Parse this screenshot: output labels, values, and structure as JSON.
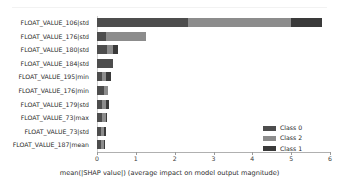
{
  "chart_data": {
    "type": "bar",
    "orientation": "horizontal",
    "stacked": true,
    "title": "",
    "xlabel": "mean(|SHAP value|) (average impact on model output magnitude)",
    "ylabel": "",
    "xlim": [
      0,
      6
    ],
    "xticks": [
      0,
      1,
      2,
      3,
      4,
      5,
      6
    ],
    "xticklabels": [
      "0",
      "1",
      "2",
      "3",
      "4",
      "5",
      "6"
    ],
    "grid": false,
    "legend_position": "lower right",
    "categories": [
      "FLOAT_VALUE_106|std",
      "FLOAT_VALUE_176|std",
      "FLOAT_VALUE_180|std",
      "FLOAT_VALUE_184|std",
      "FLOAT_VALUE_195|min",
      "FLOAT_VALUE_176|min",
      "FLOAT_VALUE_179|std",
      "FLOAT_VALUE_73|max",
      "FLOAT_VALUE_73|std",
      "FLOAT_VALUE_187|mean"
    ],
    "series": [
      {
        "name": "Class 0",
        "color": "#4d4d4d",
        "values": [
          2.35,
          0.22,
          0.27,
          0.42,
          0.12,
          0.18,
          0.14,
          0.13,
          0.11,
          0.1
        ]
      },
      {
        "name": "Class 2",
        "color": "#8c8c8c",
        "values": [
          2.65,
          1.03,
          0.13,
          0.0,
          0.12,
          0.11,
          0.1,
          0.09,
          0.08,
          0.07
        ]
      },
      {
        "name": "Class 1",
        "color": "#3a3a3a",
        "values": [
          0.8,
          0.0,
          0.15,
          0.0,
          0.11,
          0.0,
          0.06,
          0.05,
          0.03,
          0.02
        ]
      }
    ],
    "totals": [
      5.8,
      1.25,
      0.55,
      0.42,
      0.35,
      0.29,
      0.3,
      0.27,
      0.22,
      0.19
    ]
  },
  "legend": {
    "items": [
      {
        "label": "Class 0",
        "color": "#4d4d4d"
      },
      {
        "label": "Class 2",
        "color": "#8c8c8c"
      },
      {
        "label": "Class 1",
        "color": "#3a3a3a"
      }
    ]
  }
}
